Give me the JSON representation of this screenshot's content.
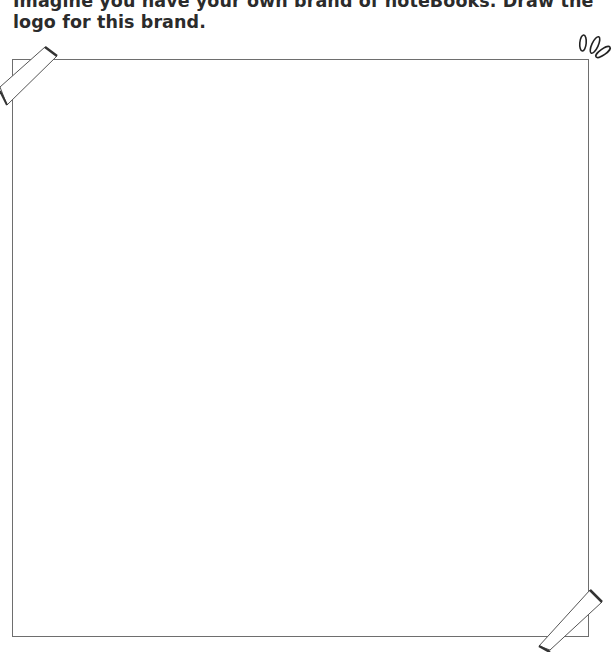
{
  "prompt": {
    "text": "Imagine you have your own brand of noteBooks. Draw the logo for this brand."
  },
  "drawing_area": {
    "label": "blank drawing frame",
    "border_color": "#6e6e6e"
  },
  "decorations": {
    "tape_top_left": "tape-icon",
    "tape_bottom_right": "tape-icon",
    "sparkle_top_right": "sparkle-icon"
  }
}
